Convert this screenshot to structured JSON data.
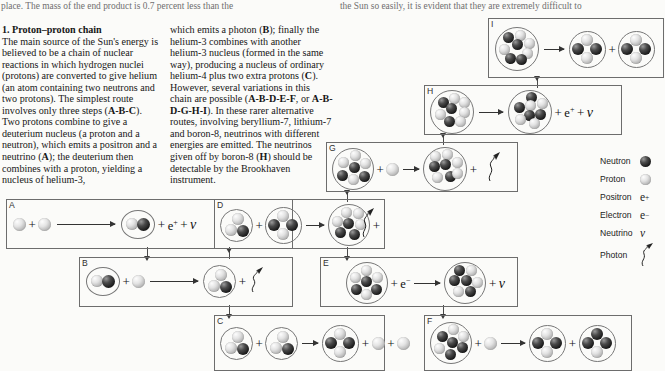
{
  "running_head": {
    "left": "place. The mass of the end product is 0.7 percent less than the",
    "right": "the Sun so easily, it is evident that they are extremely difficult to"
  },
  "article": {
    "heading": "1. Proton–proton chain",
    "column1": "The main source of the Sun's energy is believed to be a chain of nuclear reactions in which hydrogen nuclei (protons) are converted to give helium (an atom containing two neutrons and two protons). The simplest route involves only three steps (A-B-C). Two protons combine to give a deuterium nucleus (a proton and a neutron), which emits a positron and a neutrino (A); the deuterium then combines with a proton, yielding a nucleus of helium-3,",
    "column2": "which emits a photon (B); finally the helium-3 combines with another helium-3 nucleus (formed in the same way), producing a nucleus of ordinary helium-4 plus two extra protons (C). However, several variations in this chain are possible (A-B-D-E-F, or A-B-D-G-H-I). In these rarer alternative routes, involving beryllium-7, lithium-7 and boron-8, neutrinos with different energies are emitted. The neutrinos given off by boron-8 (H) should be detectable by the Brookhaven instrument."
  },
  "legend": {
    "items": [
      {
        "name": "Neutron",
        "symbol": "neutron-sphere",
        "text": ""
      },
      {
        "name": "Proton",
        "symbol": "proton-sphere",
        "text": ""
      },
      {
        "name": "Positron",
        "symbol": "text",
        "text": "e+"
      },
      {
        "name": "Electron",
        "symbol": "text",
        "text": "e−"
      },
      {
        "name": "Neutrino",
        "symbol": "text",
        "text": "ν"
      },
      {
        "name": "Photon",
        "symbol": "squiggle",
        "text": ""
      }
    ]
  },
  "panels": {
    "A": {
      "label": "A",
      "reaction": "proton + proton → deuterium + e+ + ν",
      "emits": [
        "e+",
        "ν"
      ]
    },
    "B": {
      "label": "B",
      "reaction": "deuterium + proton → helium-3 + photon",
      "emits": [
        "photon"
      ]
    },
    "C": {
      "label": "C",
      "reaction": "helium-3 + helium-3 → helium-4 + proton + proton",
      "emits": [
        "proton",
        "proton"
      ]
    },
    "D": {
      "label": "D",
      "reaction": "helium-3 + helium-4 → beryllium-7 + photon",
      "emits": [
        "photon"
      ]
    },
    "E": {
      "label": "E",
      "reaction": "beryllium-7 + e− → lithium-7 + ν",
      "emits": [
        "ν"
      ]
    },
    "F": {
      "label": "F",
      "reaction": "lithium-7 + proton → helium-4 + helium-4",
      "emits": []
    },
    "G": {
      "label": "G",
      "reaction": "beryllium-7 + proton → boron-8 + photon",
      "emits": [
        "photon"
      ]
    },
    "H": {
      "label": "H",
      "reaction": "boron-8 → beryllium-8 + e+ + ν",
      "emits": [
        "e+",
        "ν"
      ]
    },
    "I": {
      "label": "I",
      "reaction": "beryllium-8 → helium-4 + helium-4",
      "emits": []
    }
  },
  "symbols": {
    "plus": "+",
    "positron": "e",
    "positron_sup": "+",
    "electron": "e",
    "electron_sup": "−",
    "neutrino": "ν"
  },
  "colors": {
    "proton": "#d8d8d8",
    "neutron": "#1a1a1a",
    "panel_border": "#6d6d6d",
    "page_bg": "#fbfbf9",
    "text": "#161616"
  }
}
